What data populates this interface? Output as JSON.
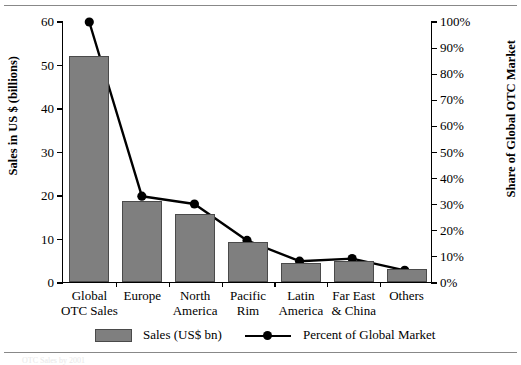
{
  "chart_data": {
    "type": "bar",
    "title": "",
    "subtitle": "",
    "xlabel": "",
    "ylabel": "Sales in US $ (billions)",
    "y2label": "Share of Global OTC Market",
    "grid": false,
    "legend_position": "bottom",
    "categories": [
      "Global\nOTC Sales",
      "Europe",
      "North\nAmerica",
      "Pacific\nRim",
      "Latin\nAmerica",
      "Far East\n& China",
      "Others"
    ],
    "ylim": [
      0,
      60
    ],
    "yticks": [
      "0",
      "10",
      "20",
      "30",
      "40",
      "50",
      "60"
    ],
    "ytick_values": [
      0,
      10,
      20,
      30,
      40,
      50,
      60
    ],
    "y2lim": [
      0,
      100
    ],
    "y2ticks": [
      "0%",
      "10%",
      "20%",
      "30%",
      "40%",
      "50%",
      "60%",
      "70%",
      "80%",
      "90%",
      "100%"
    ],
    "y2tick_values": [
      0,
      10,
      20,
      30,
      40,
      50,
      60,
      70,
      80,
      90,
      100
    ],
    "series": [
      {
        "name": "Sales (US$ bn)",
        "type": "bar",
        "axis": "left",
        "color": "#7f7f7f",
        "values": [
          52,
          18.6,
          15.6,
          9.2,
          4.4,
          4.9,
          3.0
        ]
      },
      {
        "name": "Percent of Global Market",
        "type": "line",
        "axis": "right",
        "color": "#000000",
        "values": [
          100,
          33,
          30,
          16,
          8,
          9,
          4.5
        ]
      }
    ]
  },
  "legend": {
    "items": [
      {
        "label": "Sales (US$ bn)",
        "marker": "square-swatch",
        "color": "#7f7f7f"
      },
      {
        "label": "Percent of Global Market",
        "marker": "line-dot",
        "color": "#000000"
      }
    ]
  },
  "footnote": "OTC Sales by 2001"
}
